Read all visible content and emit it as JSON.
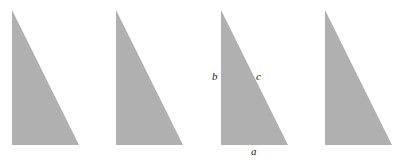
{
  "figure": {
    "background_color": "#ffffff",
    "width": 406,
    "height": 160,
    "shape_fill": "#b0b0b0",
    "label_color": "#1a1a1a"
  },
  "triangles": [
    {
      "index": 1,
      "name": "triangle-1",
      "apex": {
        "x": 12,
        "y": 10
      },
      "bottom_left": {
        "x": 12,
        "y": 145
      },
      "bottom_right": {
        "x": 79,
        "y": 145
      },
      "labeled": false
    },
    {
      "index": 2,
      "name": "triangle-2",
      "apex": {
        "x": 116,
        "y": 10
      },
      "bottom_left": {
        "x": 116,
        "y": 145
      },
      "bottom_right": {
        "x": 183,
        "y": 145
      },
      "labeled": false
    },
    {
      "index": 3,
      "name": "triangle-3",
      "apex": {
        "x": 221,
        "y": 10
      },
      "bottom_left": {
        "x": 221,
        "y": 145
      },
      "bottom_right": {
        "x": 288,
        "y": 145
      },
      "labeled": true
    },
    {
      "index": 4,
      "name": "triangle-4",
      "apex": {
        "x": 325,
        "y": 10
      },
      "bottom_left": {
        "x": 325,
        "y": 145
      },
      "bottom_right": {
        "x": 392,
        "y": 145
      },
      "labeled": false
    }
  ],
  "labels": {
    "leg_vertical": "b",
    "hypotenuse": "c",
    "leg_horizontal": "a"
  }
}
